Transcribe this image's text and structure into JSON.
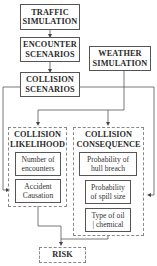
{
  "nodes": {
    "traffic": "TRAFFIC SIMULATION",
    "traffic_l1": "TRAFFIC",
    "traffic_l2": "SIMULATION",
    "encounter_l1": "ENCOUNTER",
    "encounter_l2": "SCENARIOS",
    "weather_l1": "WEATHER",
    "weather_l2": "SIMULATION",
    "collision_l1": "COLLISION",
    "collision_l2": "SCENARIOS",
    "likelihood": {
      "title_l1": "COLLISION",
      "title_l2": "LIKELIHOOD",
      "items": [
        {
          "l1": "Number of",
          "l2": "encounters"
        },
        {
          "l1": "Accident",
          "l2": "Causation"
        }
      ]
    },
    "consequence": {
      "title_l1": "COLLISION",
      "title_l2": "CONSEQUENCE",
      "items": [
        {
          "l1": "Probability of",
          "l2": "hull breach"
        },
        {
          "l1": "Probability",
          "l2": "of spill size"
        },
        {
          "l1": "Type of oil",
          "l2": "| chemical"
        }
      ]
    },
    "risk": "RISK"
  },
  "colors": {
    "line": "#555555",
    "dashed_border": "#888888",
    "text": "#2a2a2a"
  }
}
